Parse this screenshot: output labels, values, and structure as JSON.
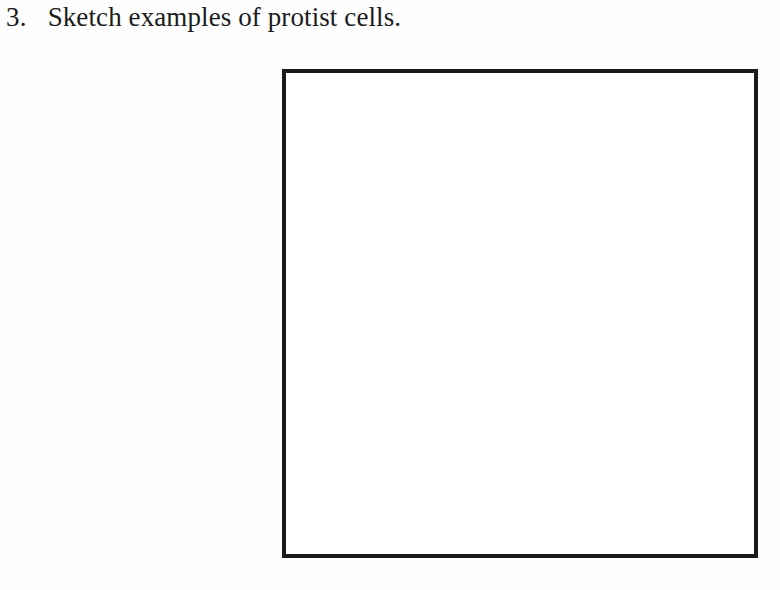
{
  "document": {
    "background_color": "#fefefe",
    "text_color": "#1b1b1b"
  },
  "question": {
    "number": "3.",
    "text": "Sketch examples of protist cells."
  },
  "answer_box": {
    "label": "",
    "border_color": "#1a1a1a",
    "fill_color": "#ffffff",
    "contents": ""
  }
}
